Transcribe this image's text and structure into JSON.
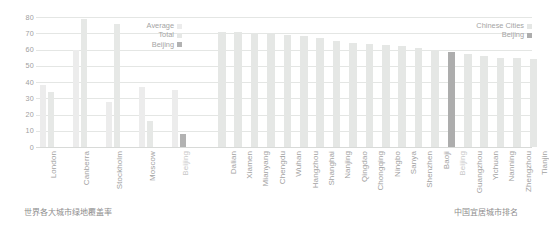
{
  "captions": {
    "left": "世界各大城市绿地覆盖率",
    "right": "中国宜居城市排名"
  },
  "legend_left": {
    "items": [
      {
        "label": "Average",
        "color": "#ececec"
      },
      {
        "label": "Total",
        "color": "#e6e8e6"
      },
      {
        "label": "Beijing",
        "color": "#b2b2b2"
      }
    ]
  },
  "legend_right": {
    "items": [
      {
        "label": "Chinese Cities",
        "color": "#e5e7e5"
      },
      {
        "label": "Beijing",
        "color": "#adadad"
      }
    ]
  },
  "chart_data": [
    {
      "type": "bar",
      "title": "",
      "xlabel": "",
      "ylabel": "",
      "ylim": [
        0,
        80
      ],
      "yticks": [
        0,
        10,
        20,
        30,
        40,
        50,
        60,
        70,
        80
      ],
      "grid": true,
      "legend_position": "top-right",
      "categories": [
        "London",
        "Canberra",
        "Stockholm",
        "Moscow",
        "Beijing"
      ],
      "highlight": "Beijing",
      "series": [
        {
          "name": "Average",
          "values": [
            38,
            60,
            28,
            37,
            35
          ]
        },
        {
          "name": "Total",
          "values": [
            34,
            78.5,
            76,
            16,
            8
          ]
        }
      ]
    },
    {
      "type": "bar",
      "title": "",
      "xlabel": "",
      "ylabel": "",
      "ylim": [
        0,
        80
      ],
      "grid": true,
      "legend_position": "top-right",
      "highlight": "Beijing",
      "categories": [
        "Dalian",
        "Xiamen",
        "Mianyang",
        "Chengdu",
        "Wuhan",
        "Hangzhou",
        "Shanghai",
        "Nanjing",
        "Qingdao",
        "Chongqing",
        "Ningbo",
        "Sanya",
        "Shenzhen",
        "Baoji",
        "Beijing",
        "Guangzhou",
        "Yichuan",
        "Nanning",
        "Zhengzhou",
        "Tianjin"
      ],
      "series": [
        {
          "name": "Chinese Cities",
          "values": [
            70.5,
            70.5,
            70,
            69.5,
            69,
            68.5,
            67,
            65.5,
            64,
            63.5,
            62.5,
            62,
            61,
            60,
            58.5,
            57.5,
            56,
            55,
            55,
            54
          ]
        }
      ]
    }
  ],
  "yticks": [
    "80",
    "70",
    "60",
    "50",
    "40",
    "30",
    "20",
    "10",
    "0"
  ]
}
